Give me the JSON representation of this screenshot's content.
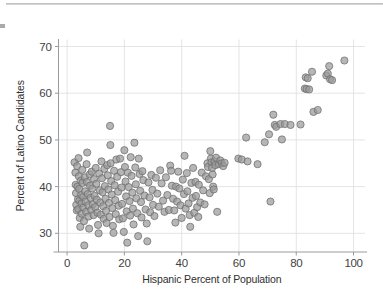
{
  "figure": {
    "background_color": "#ffffff",
    "has_top_rule": true,
    "top_rule_color": "#c3c3c3"
  },
  "style": {
    "marker_fill": "#9a9a9a",
    "marker_stroke": "#6f6f6f",
    "marker_opacity": 0.72,
    "marker_radius_px": 3.6,
    "grid_color": "#dddddd",
    "axis_color": "#9b9b9b",
    "text_color": "#3a3a3a"
  },
  "chart_data": {
    "type": "scatter",
    "title": "",
    "xlabel": "Hispanic Percent of Population",
    "ylabel": "Percent of Latino Candidates",
    "xlim": [
      -3,
      104
    ],
    "ylim": [
      26,
      71.5
    ],
    "xticks": [
      0,
      20,
      40,
      60,
      80,
      100
    ],
    "yticks": [
      30,
      40,
      50,
      60,
      70
    ],
    "xtick_labels": [
      "0",
      "20",
      "40",
      "60",
      "80",
      "100"
    ],
    "ytick_labels": [
      "30",
      "40",
      "50",
      "60",
      "70"
    ],
    "grid": true,
    "grid_axis": "both",
    "legend": false,
    "legend_position": "none",
    "series": [
      {
        "name": "districts",
        "marker": "circle",
        "points": [
          [
            2.6,
            45.2
          ],
          [
            2.9,
            43.0
          ],
          [
            3.0,
            40.4
          ],
          [
            3.1,
            38.6
          ],
          [
            3.2,
            36.1
          ],
          [
            3.4,
            34.9
          ],
          [
            3.5,
            44.4
          ],
          [
            3.6,
            40.0
          ],
          [
            3.8,
            37.3
          ],
          [
            3.9,
            35.2
          ],
          [
            4.0,
            46.1
          ],
          [
            4.1,
            42.2
          ],
          [
            4.2,
            39.5
          ],
          [
            4.3,
            37.0
          ],
          [
            4.4,
            33.3
          ],
          [
            4.6,
            31.4
          ],
          [
            4.8,
            41.3
          ],
          [
            4.9,
            38.2
          ],
          [
            5.0,
            36.4
          ],
          [
            5.1,
            34.2
          ],
          [
            5.3,
            43.6
          ],
          [
            5.4,
            40.8
          ],
          [
            5.6,
            37.8
          ],
          [
            5.7,
            35.5
          ],
          [
            5.9,
            32.6
          ],
          [
            6.0,
            27.4
          ],
          [
            6.2,
            42.0
          ],
          [
            6.3,
            39.0
          ],
          [
            6.5,
            36.8
          ],
          [
            6.6,
            34.6
          ],
          [
            6.8,
            44.8
          ],
          [
            6.9,
            41.0
          ],
          [
            7.0,
            47.3
          ],
          [
            7.2,
            38.4
          ],
          [
            7.4,
            36.0
          ],
          [
            7.5,
            33.6
          ],
          [
            7.7,
            31.0
          ],
          [
            7.9,
            42.6
          ],
          [
            8.0,
            40.2
          ],
          [
            8.2,
            37.6
          ],
          [
            8.4,
            35.0
          ],
          [
            8.6,
            43.2
          ],
          [
            8.8,
            39.6
          ],
          [
            9.0,
            36.2
          ],
          [
            9.2,
            33.9
          ],
          [
            9.4,
            41.6
          ],
          [
            9.6,
            38.0
          ],
          [
            9.8,
            35.6
          ],
          [
            10.0,
            44.0
          ],
          [
            10.2,
            40.6
          ],
          [
            10.4,
            37.2
          ],
          [
            10.6,
            34.4
          ],
          [
            10.8,
            31.8
          ],
          [
            11.0,
            30.0
          ],
          [
            11.2,
            42.8
          ],
          [
            11.4,
            39.2
          ],
          [
            11.6,
            36.6
          ],
          [
            11.8,
            34.0
          ],
          [
            12.0,
            45.4
          ],
          [
            12.2,
            41.8
          ],
          [
            12.4,
            38.8
          ],
          [
            12.6,
            35.8
          ],
          [
            12.8,
            33.1
          ],
          [
            13.0,
            43.8
          ],
          [
            13.2,
            40.1
          ],
          [
            13.4,
            37.4
          ],
          [
            13.6,
            34.8
          ],
          [
            13.8,
            32.2
          ],
          [
            14.0,
            44.6
          ],
          [
            14.2,
            42.4
          ],
          [
            14.4,
            39.4
          ],
          [
            14.6,
            36.5
          ],
          [
            14.8,
            33.5
          ],
          [
            15.0,
            53.0
          ],
          [
            15.1,
            48.9
          ],
          [
            15.2,
            45.0
          ],
          [
            15.4,
            41.2
          ],
          [
            15.6,
            38.3
          ],
          [
            15.8,
            35.4
          ],
          [
            16.0,
            31.6
          ],
          [
            16.2,
            30.1
          ],
          [
            16.4,
            43.4
          ],
          [
            16.6,
            40.3
          ],
          [
            16.8,
            37.1
          ],
          [
            17.0,
            34.1
          ],
          [
            17.2,
            45.8
          ],
          [
            17.5,
            42.1
          ],
          [
            17.8,
            38.9
          ],
          [
            18.0,
            35.9
          ],
          [
            18.2,
            33.0
          ],
          [
            18.5,
            46.0
          ],
          [
            18.8,
            43.1
          ],
          [
            19.0,
            39.8
          ],
          [
            19.2,
            36.3
          ],
          [
            19.5,
            33.2
          ],
          [
            19.8,
            30.3
          ],
          [
            20.0,
            47.8
          ],
          [
            20.2,
            44.2
          ],
          [
            20.4,
            41.1
          ],
          [
            20.6,
            37.9
          ],
          [
            20.8,
            34.7
          ],
          [
            21.0,
            28.0
          ],
          [
            21.2,
            43.0
          ],
          [
            21.5,
            39.9
          ],
          [
            21.8,
            36.9
          ],
          [
            22.0,
            33.8
          ],
          [
            22.2,
            46.3
          ],
          [
            22.5,
            42.3
          ],
          [
            22.8,
            38.7
          ],
          [
            23.0,
            35.3
          ],
          [
            23.2,
            31.9
          ],
          [
            23.5,
            49.4
          ],
          [
            23.8,
            44.1
          ],
          [
            24.0,
            40.5
          ],
          [
            24.2,
            37.5
          ],
          [
            24.5,
            34.3
          ],
          [
            24.8,
            29.4
          ],
          [
            25.0,
            46.0
          ],
          [
            25.3,
            42.7
          ],
          [
            25.5,
            39.1
          ],
          [
            25.8,
            36.7
          ],
          [
            26.0,
            33.4
          ],
          [
            26.3,
            43.3
          ],
          [
            26.6,
            41.4
          ],
          [
            27.0,
            38.1
          ],
          [
            27.4,
            35.1
          ],
          [
            27.8,
            32.1
          ],
          [
            28.0,
            28.3
          ],
          [
            28.4,
            40.9
          ],
          [
            28.8,
            37.7
          ],
          [
            29.0,
            34.5
          ],
          [
            29.4,
            42.5
          ],
          [
            29.8,
            39.3
          ],
          [
            30.0,
            36.1
          ],
          [
            30.5,
            33.7
          ],
          [
            31.0,
            41.9
          ],
          [
            31.5,
            38.5
          ],
          [
            32.0,
            35.7
          ],
          [
            32.5,
            43.5
          ],
          [
            33.0,
            40.7
          ],
          [
            33.5,
            37.0
          ],
          [
            34.0,
            34.6
          ],
          [
            34.5,
            42.0
          ],
          [
            35.0,
            38.2
          ],
          [
            35.5,
            35.0
          ],
          [
            36.0,
            44.5
          ],
          [
            36.3,
            43.4
          ],
          [
            36.6,
            40.2
          ],
          [
            37.0,
            37.4
          ],
          [
            37.4,
            34.9
          ],
          [
            37.8,
            32.3
          ],
          [
            38.0,
            40.0
          ],
          [
            38.4,
            36.8
          ],
          [
            38.8,
            43.2
          ],
          [
            39.2,
            39.6
          ],
          [
            39.6,
            36.0
          ],
          [
            40.0,
            33.3
          ],
          [
            40.4,
            41.5
          ],
          [
            40.8,
            38.4
          ],
          [
            41.0,
            46.6
          ],
          [
            41.4,
            35.3
          ],
          [
            41.8,
            42.9
          ],
          [
            42.0,
            39.0
          ],
          [
            42.4,
            36.4
          ],
          [
            42.8,
            33.9
          ],
          [
            43.0,
            31.4
          ],
          [
            43.4,
            40.8
          ],
          [
            43.8,
            37.6
          ],
          [
            44.0,
            44.0
          ],
          [
            44.4,
            34.4
          ],
          [
            44.8,
            41.0
          ],
          [
            45.0,
            38.0
          ],
          [
            45.4,
            35.6
          ],
          [
            45.8,
            33.5
          ],
          [
            46.0,
            40.4
          ],
          [
            46.5,
            36.6
          ],
          [
            47.0,
            43.0
          ],
          [
            47.5,
            39.2
          ],
          [
            48.0,
            36.2
          ],
          [
            48.5,
            42.2
          ],
          [
            49.0,
            45.0
          ],
          [
            49.2,
            44.2
          ],
          [
            49.5,
            41.6
          ],
          [
            49.8,
            38.6
          ],
          [
            50.0,
            47.6
          ],
          [
            50.2,
            46.0
          ],
          [
            50.4,
            45.2
          ],
          [
            50.6,
            44.0
          ],
          [
            50.8,
            42.6
          ],
          [
            51.0,
            40.0
          ],
          [
            51.2,
            39.4
          ],
          [
            51.5,
            45.4
          ],
          [
            51.8,
            44.6
          ],
          [
            52.0,
            46.2
          ],
          [
            52.4,
            34.6
          ],
          [
            53.0,
            44.8
          ],
          [
            53.5,
            45.6
          ],
          [
            54.0,
            45.0
          ],
          [
            54.5,
            44.4
          ],
          [
            55.0,
            45.1
          ],
          [
            59.8,
            46.0
          ],
          [
            61.0,
            45.8
          ],
          [
            62.5,
            50.5
          ],
          [
            63.0,
            45.4
          ],
          [
            66.5,
            44.8
          ],
          [
            69.0,
            49.5
          ],
          [
            70.5,
            51.2
          ],
          [
            71.0,
            36.8
          ],
          [
            72.0,
            55.4
          ],
          [
            72.5,
            53.2
          ],
          [
            73.0,
            52.8
          ],
          [
            74.5,
            53.4
          ],
          [
            75.0,
            50.1
          ],
          [
            76.0,
            53.4
          ],
          [
            78.0,
            53.2
          ],
          [
            81.5,
            53.3
          ],
          [
            83.0,
            61.0
          ],
          [
            83.3,
            63.4
          ],
          [
            83.6,
            60.9
          ],
          [
            84.0,
            63.2
          ],
          [
            84.5,
            60.8
          ],
          [
            85.5,
            64.6
          ],
          [
            86.0,
            56.0
          ],
          [
            87.5,
            56.4
          ],
          [
            90.5,
            63.8
          ],
          [
            91.0,
            64.2
          ],
          [
            91.5,
            65.8
          ],
          [
            91.8,
            63.0
          ],
          [
            92.5,
            62.8
          ],
          [
            96.8,
            67.0
          ]
        ]
      }
    ]
  }
}
